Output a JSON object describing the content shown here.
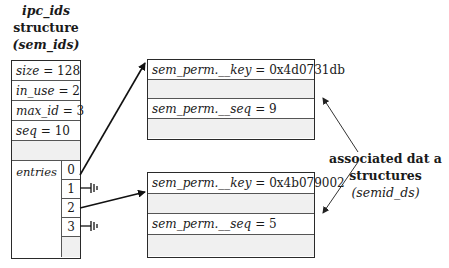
{
  "title": {
    "line1": "ipc_ids",
    "line2": "structure",
    "line3": "(sem_ids)"
  },
  "ipc_ids": {
    "fields": [
      {
        "name": "size",
        "value": "= 128"
      },
      {
        "name": "in_use",
        "value": "= 2"
      },
      {
        "name": "max_id",
        "value": "= 3"
      },
      {
        "name": "seq",
        "value": "= 10"
      }
    ],
    "entries_label": "entries",
    "indices": [
      "0",
      "1",
      "2",
      "3"
    ]
  },
  "semid_ds": [
    {
      "key_name": "sem_perm.__key",
      "key_value": "= 0x4d0731db",
      "seq_name": "sem_perm.__seq",
      "seq_value": "= 9"
    },
    {
      "key_name": "sem_perm.__key",
      "key_value": "= 0x4b079002",
      "seq_name": "sem_perm.__seq",
      "seq_value": "= 5"
    }
  ],
  "side_label": {
    "line1": "associated dat a",
    "line2": "structures",
    "line3": "(semid_ds)"
  },
  "pointers": [
    {
      "from_index": "0",
      "to": "semid_ds[0]"
    },
    {
      "from_index": "1",
      "to": "null"
    },
    {
      "from_index": "2",
      "to": "semid_ds[1]"
    },
    {
      "from_index": "3",
      "to": "null"
    }
  ]
}
